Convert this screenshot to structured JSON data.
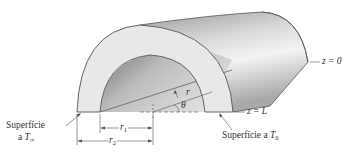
{
  "figure": {
    "colors": {
      "background": "#ffffff",
      "front_face": "#e6e6e6",
      "outline": "#555555",
      "shell_light": "#f2f2f2",
      "shell_dark": "#8c8c8c",
      "text": "#333333"
    }
  },
  "labels": {
    "left_surface": {
      "line1": "Superfície",
      "line2_prefix": "a ",
      "line2_var": "T",
      "line2_sub": "∞"
    },
    "right_surface": {
      "prefix": "Superfície a ",
      "var": "T",
      "sub": "0"
    },
    "z_end": {
      "text": "z = 0"
    },
    "z_front": {
      "text": "z = L"
    },
    "inner_radius": {
      "var": "r",
      "sub": "1"
    },
    "outer_radius": {
      "var": "r",
      "sub": "2"
    },
    "radius": {
      "var": "r"
    },
    "angle": {
      "var": "θ"
    }
  }
}
